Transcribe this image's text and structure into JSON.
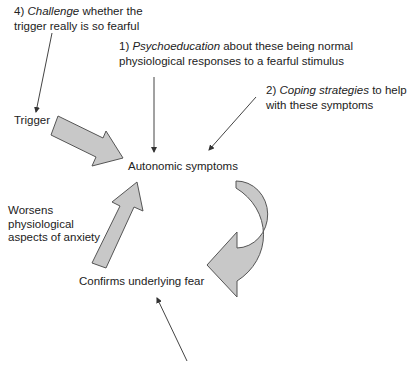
{
  "diagram": {
    "nodes": {
      "trigger": "Trigger",
      "autonomic": "Autonomic symptoms",
      "confirms": "Confirms underlying fear",
      "worsens": [
        "Worsens",
        "physiological",
        "aspects of anxiety"
      ]
    },
    "interventions": {
      "i1": {
        "num": "1)",
        "em": "Psychoeducation",
        "rest": " about these being normal",
        "line2": "physiological responses to a fearful stimulus"
      },
      "i2": {
        "num": "2)",
        "em": "Coping strategies",
        "rest": " to help",
        "line2": "with these symptoms"
      },
      "i4": {
        "num": "4)",
        "em": "Challenge",
        "rest": " whether the",
        "line2": "trigger really is so fearful"
      }
    },
    "colors": {
      "arrow_fill": "#c8c8c8",
      "arrow_stroke": "#555555",
      "line": "#444444"
    }
  }
}
